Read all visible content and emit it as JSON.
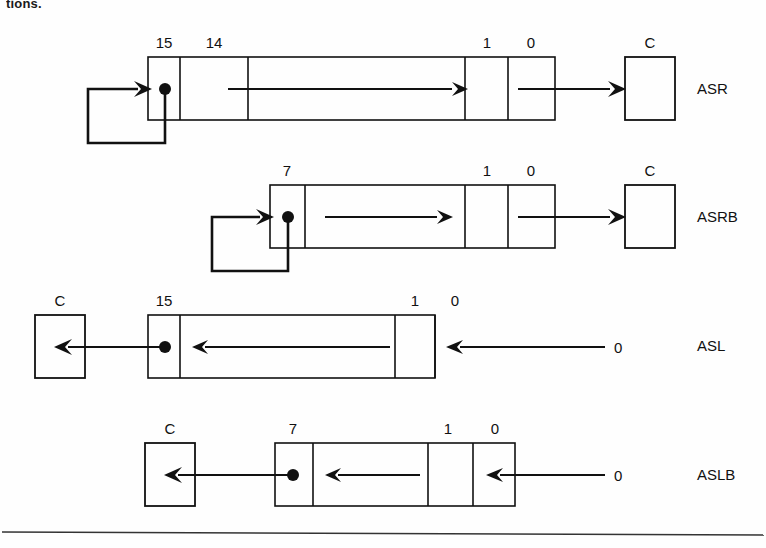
{
  "page": {
    "top_fragment": "tions.",
    "background_color": "#fefefe",
    "ink_color": "#111111",
    "width": 766,
    "height": 548
  },
  "diagram": {
    "title_fragment": "tions.",
    "rows": [
      {
        "id": "asr",
        "label": "ASR",
        "label_x": 697,
        "label_y": 94,
        "direction": "right",
        "has_feedback_loop": true,
        "sign_dot": true,
        "carry_box": {
          "label": "C",
          "x": 625,
          "y": 57,
          "w": 50,
          "h": 63,
          "side": "right"
        },
        "register": {
          "x": 148,
          "y": 57,
          "w": 407,
          "h": 63
        },
        "bit_labels": [
          {
            "text": "15",
            "x": 164,
            "y": 48
          },
          {
            "text": "14",
            "x": 214,
            "y": 48
          },
          {
            "text": "1",
            "x": 487,
            "y": 48
          },
          {
            "text": "0",
            "x": 531,
            "y": 48
          }
        ],
        "dividers": [
          180,
          248,
          465,
          508
        ],
        "input_zero": null
      },
      {
        "id": "asrb",
        "label": "ASRB",
        "label_x": 697,
        "label_y": 222,
        "direction": "right",
        "has_feedback_loop": true,
        "sign_dot": true,
        "carry_box": {
          "label": "C",
          "x": 625,
          "y": 185,
          "w": 50,
          "h": 63,
          "side": "right"
        },
        "register": {
          "x": 270,
          "y": 185,
          "w": 285,
          "h": 63
        },
        "bit_labels": [
          {
            "text": "7",
            "x": 287,
            "y": 176
          },
          {
            "text": "1",
            "x": 487,
            "y": 176
          },
          {
            "text": "0",
            "x": 531,
            "y": 176
          }
        ],
        "dividers": [
          305,
          465,
          508
        ],
        "input_zero": null
      },
      {
        "id": "asl",
        "label": "ASL",
        "label_x": 697,
        "label_y": 351,
        "direction": "left",
        "has_feedback_loop": false,
        "sign_dot": true,
        "carry_box": {
          "label": "C",
          "x": 35,
          "y": 315,
          "w": 50,
          "h": 63,
          "side": "left"
        },
        "register": {
          "x": 148,
          "y": 315,
          "w": 287,
          "h": 63
        },
        "bit_labels": [
          {
            "text": "15",
            "x": 164,
            "y": 306
          },
          {
            "text": "1",
            "x": 415,
            "y": 306
          },
          {
            "text": "0",
            "x": 455,
            "y": 306
          }
        ],
        "dividers": [
          180,
          395,
          435
        ],
        "input_zero": {
          "text": "0",
          "x": 620,
          "y": 356
        }
      },
      {
        "id": "aslb",
        "label": "ASLB",
        "label_x": 697,
        "label_y": 480,
        "direction": "left",
        "has_feedback_loop": false,
        "sign_dot": true,
        "carry_box": {
          "label": "C",
          "x": 145,
          "y": 443,
          "w": 50,
          "h": 63,
          "side": "left"
        },
        "register": {
          "x": 275,
          "y": 443,
          "w": 240,
          "h": 63
        },
        "bit_labels": [
          {
            "text": "7",
            "x": 293,
            "y": 434
          },
          {
            "text": "1",
            "x": 448,
            "y": 434
          },
          {
            "text": "0",
            "x": 495,
            "y": 434
          }
        ],
        "dividers": [
          313,
          428,
          473
        ],
        "input_zero": {
          "text": "0",
          "x": 620,
          "y": 484
        }
      }
    ],
    "footer_rule": {
      "y": 533,
      "x1": 2,
      "x2": 764
    }
  }
}
